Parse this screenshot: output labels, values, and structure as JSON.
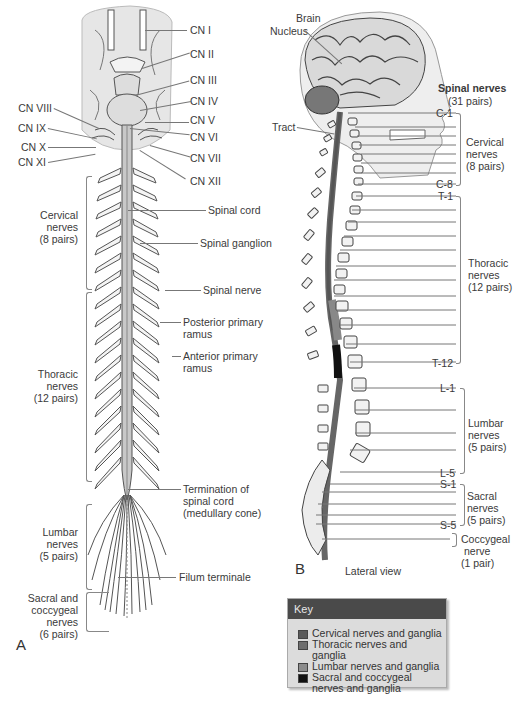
{
  "panel_a": {
    "letter": "A",
    "cranial_nerves_right": [
      "CN I",
      "CN II",
      "CN III",
      "CN IV",
      "CN V",
      "CN VI",
      "CN VII",
      "CN XII"
    ],
    "cranial_nerves_left": [
      "CN VIII",
      "CN IX",
      "CN X",
      "CN XI"
    ],
    "right_labels": {
      "spinal_cord": "Spinal cord",
      "spinal_ganglion": "Spinal ganglion",
      "spinal_nerve": "Spinal nerve",
      "posterior_ramus_1": "Posterior primary",
      "posterior_ramus_2": "ramus",
      "anterior_ramus_1": "Anterior primary",
      "anterior_ramus_2": "ramus",
      "termination_1": "Termination of",
      "termination_2": "spinal cord",
      "termination_3": "(medullary cone)",
      "filum": "Filum terminale"
    },
    "groups": {
      "cervical": [
        "Cervical",
        "nerves",
        "(8 pairs)"
      ],
      "thoracic": [
        "Thoracic",
        "nerves",
        "(12 pairs)"
      ],
      "lumbar": [
        "Lumbar",
        "nerves",
        "(5 pairs)"
      ],
      "sacral": [
        "Sacral and",
        "coccygeal",
        "nerves",
        "(6 pairs)"
      ]
    }
  },
  "panel_b": {
    "letter": "B",
    "caption": "Lateral view",
    "brain": "Brain",
    "nucleus": "Nucleus",
    "tract": "Tract",
    "title_1": "Spinal nerves",
    "title_2": "(31 pairs)",
    "levels": {
      "c1": "C-1",
      "c8": "C-8",
      "t1": "T-1",
      "t12": "T-12",
      "l1": "L-1",
      "l5": "L-5",
      "s1": "S-1",
      "s5": "S-5"
    },
    "groups": {
      "cervical": [
        "Cervical",
        "nerves",
        "(8 pairs)"
      ],
      "thoracic": [
        "Thoracic",
        "nerves",
        "(12 pairs)"
      ],
      "lumbar": [
        "Lumbar",
        "nerves",
        "(5 pairs)"
      ],
      "sacral": [
        "Sacral",
        "nerves",
        "(5 pairs)"
      ],
      "coccygeal": [
        "Coccygeal",
        "nerve",
        "(1 pair)"
      ]
    }
  },
  "key": {
    "title": "Key",
    "items": [
      {
        "label": "Cervical nerves and ganglia",
        "color": "#5a5a5a"
      },
      {
        "label": "Thoracic nerves and ganglia",
        "color": "#6e6e6e"
      },
      {
        "label": "Lumbar nerves and ganglia",
        "color": "#8c8c8c"
      },
      {
        "label": "Sacral and coccygeal",
        "label2": "nerves and ganglia",
        "color": "#111111"
      }
    ]
  }
}
